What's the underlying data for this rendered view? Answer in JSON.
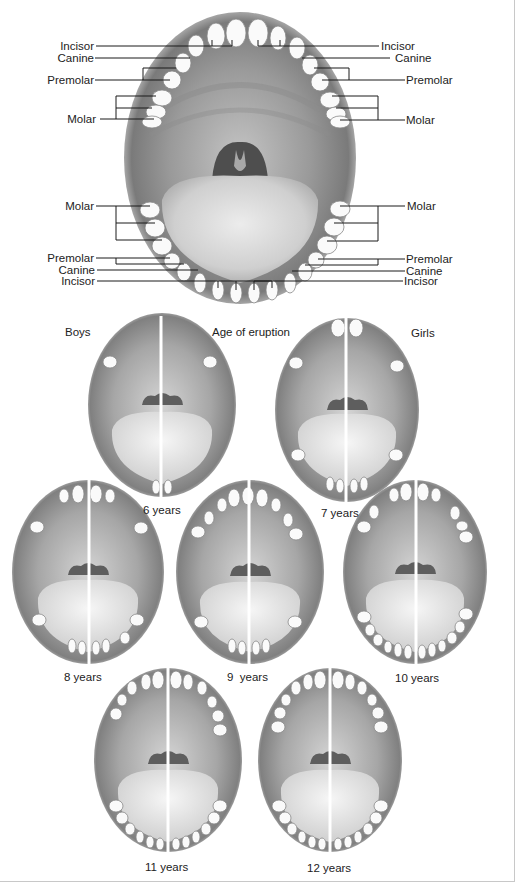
{
  "figure": {
    "title": "Age of eruption",
    "left_heading": "Boys",
    "right_heading": "Girls"
  },
  "main_diagram": {
    "upper_jaw": {
      "left_labels": [
        "Incisor",
        "Canine",
        "Premolar",
        "Molar"
      ],
      "right_labels": [
        "Incisor",
        "Canine",
        "Premolar",
        "Molar"
      ]
    },
    "lower_jaw": {
      "left_labels": [
        "Molar",
        "Premolar",
        "Canine",
        "Incisor"
      ],
      "right_labels": [
        "Molar",
        "Premolar",
        "Canine",
        "Incisor"
      ]
    }
  },
  "stages": [
    {
      "label": "6 years"
    },
    {
      "label": "7 years"
    },
    {
      "label": "8 years"
    },
    {
      "label": "9  years"
    },
    {
      "label": "10 years"
    },
    {
      "label": "11 years"
    },
    {
      "label": "12 years"
    }
  ],
  "colors": {
    "background": "#ffffff",
    "mouth_dark": "#6e6e6e",
    "mouth_mid": "#a8a8a8",
    "tongue": "#d9d9d9",
    "tooth": "#fafafa",
    "leader_line": "#1a1a1a",
    "frame": "#c8c8c8"
  }
}
